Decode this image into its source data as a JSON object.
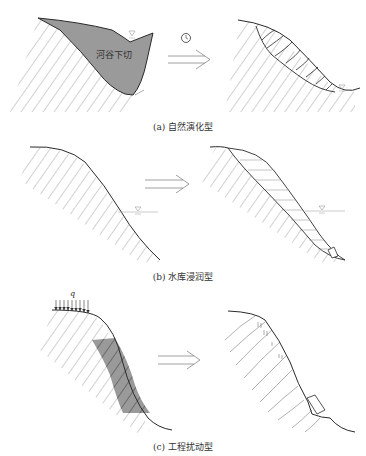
{
  "panels": [
    {
      "id": "a",
      "caption": "(a) 自然演化型",
      "inner_label": "河谷下切",
      "icons": [
        "clock-icon",
        "water-level-icon",
        "double-arrow-icon"
      ]
    },
    {
      "id": "b",
      "caption": "(b) 水库浸润型",
      "icons": [
        "water-level-icon",
        "double-arrow-icon"
      ]
    },
    {
      "id": "c",
      "caption": "(c) 工程扰动型",
      "load_label": "q",
      "icons": [
        "distributed-load-icon",
        "double-arrow-icon"
      ]
    }
  ],
  "colors": {
    "line": "#2a2a2a",
    "hatch": "#7a7a7a",
    "shade": "#9a9a9a",
    "water": "#999999"
  }
}
